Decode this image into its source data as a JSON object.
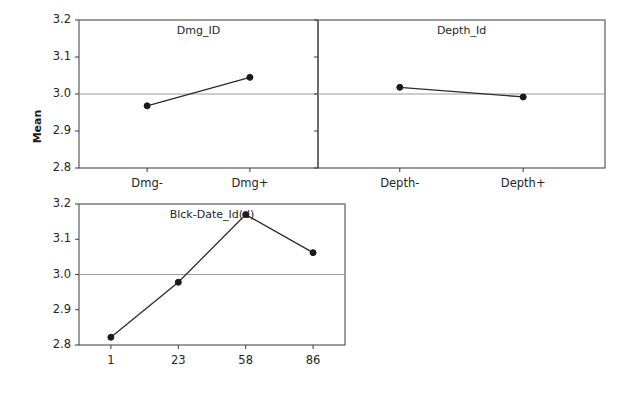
{
  "chart_data": {
    "type": "line",
    "title": "",
    "ylabel": "Mean",
    "xlabel": "",
    "ylim": [
      2.8,
      3.2
    ],
    "yticks": [
      2.8,
      2.9,
      3.0,
      3.1,
      3.2
    ],
    "ytick_labels": [
      "2.8",
      "2.9",
      "3.0",
      "3.1",
      "3.2"
    ],
    "gridlines": [
      3.0,
      3.2
    ],
    "grid": true,
    "legend": "none",
    "panels": [
      {
        "id": "dmg",
        "title": "Dmg_ID",
        "categories": [
          "Dmg-",
          "Dmg+"
        ],
        "values": [
          2.968,
          3.045
        ]
      },
      {
        "id": "depth",
        "title": "Depth_Id",
        "categories": [
          "Depth-",
          "Depth+"
        ],
        "values": [
          3.018,
          2.992
        ]
      },
      {
        "id": "blck_date",
        "title": "Blck-Date_Id(d)",
        "categories": [
          "1",
          "23",
          "58",
          "86"
        ],
        "values": [
          2.822,
          2.978,
          3.17,
          3.062
        ]
      }
    ],
    "colors": {
      "line": "#2b2b2b",
      "marker": "#1a1a1a",
      "axis": "#3a3a3a",
      "grid": "#9a9a9a",
      "background": "#ffffff"
    }
  }
}
